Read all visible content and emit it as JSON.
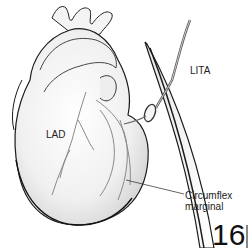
{
  "figure": {
    "type": "medical-illustration",
    "labels": {
      "lita": "LITA",
      "lad": "LAD",
      "circumflex_line1": "Circumflex",
      "circumflex_line2": "marginal"
    },
    "page_number": "16",
    "colors": {
      "outline": "#1a1a1a",
      "fill": "#f2f2f2",
      "shade": "#d9d9d9",
      "vessel": "#8a8a8a",
      "background": "#ffffff"
    }
  }
}
